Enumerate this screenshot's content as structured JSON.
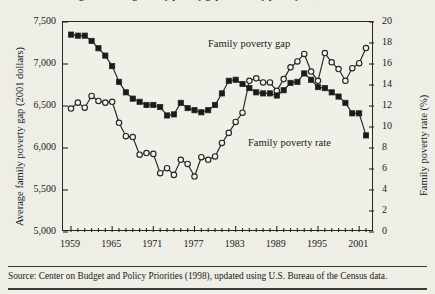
{
  "figure": {
    "title_clipped": "Figure 2. Average family poverty gap and family poverty rate, 1959-2002",
    "source_note": "Source: Center on Budget and Policy Priorities (1998), updated using U.S. Bureau of the Census data."
  },
  "annotations": {
    "gap_label": "Family poverty gap",
    "rate_label": "Family poverty rate"
  },
  "axes": {
    "left_title": "Average family poverty gap (2001 dollars)",
    "right_title": "Family poverty rate (%)",
    "left_ticks": [
      "7,500",
      "7,000",
      "6,500",
      "6,000",
      "5,500",
      "5,000"
    ],
    "right_ticks": [
      "20",
      "18",
      "16",
      "14",
      "12",
      "10",
      "8",
      "6",
      "4",
      "2",
      "0"
    ],
    "x_ticks": [
      "1959",
      "1965",
      "1971",
      "1977",
      "1983",
      "1989",
      "1995",
      "2001"
    ]
  },
  "colors": {
    "background": "#efeee6",
    "plot_background": "#f1f0e8",
    "ink": "#262626",
    "marker_fill_gap": "#f5f4ec",
    "marker_fill_rate": "#1a1a1a"
  },
  "chart_data": {
    "type": "line",
    "title": "Average family poverty gap and family poverty rate, 1959-2002",
    "xlabel": "",
    "ylabel": "Average family poverty gap (2001 dollars)",
    "y2label": "Family poverty rate (%)",
    "xlim": [
      1959,
      2002
    ],
    "ylim": [
      5000,
      7500
    ],
    "y2lim": [
      0,
      20
    ],
    "grid": false,
    "legend": "inline annotations",
    "x": [
      1959,
      1960,
      1961,
      1962,
      1963,
      1964,
      1965,
      1966,
      1967,
      1968,
      1969,
      1970,
      1971,
      1972,
      1973,
      1974,
      1975,
      1976,
      1977,
      1978,
      1979,
      1980,
      1981,
      1982,
      1983,
      1984,
      1985,
      1986,
      1987,
      1988,
      1989,
      1990,
      1991,
      1992,
      1993,
      1994,
      1995,
      1996,
      1997,
      1998,
      1999,
      2000,
      2001,
      2002
    ],
    "series": [
      {
        "name": "Family poverty gap",
        "axis": "left",
        "marker": "open-circle",
        "values": [
          6470,
          6540,
          6480,
          6620,
          6560,
          6540,
          6550,
          6300,
          6140,
          6130,
          5920,
          5940,
          5930,
          5700,
          5760,
          5680,
          5860,
          5810,
          5660,
          5890,
          5860,
          5900,
          6060,
          6180,
          6310,
          6420,
          6800,
          6830,
          6780,
          6780,
          6680,
          6820,
          6960,
          7030,
          7120,
          6910,
          6800,
          7130,
          7020,
          6940,
          6800,
          6950,
          7010,
          7190
        ]
      },
      {
        "name": "Family poverty rate",
        "axis": "right",
        "marker": "filled-square",
        "values": [
          18.8,
          18.7,
          18.7,
          18.2,
          17.5,
          16.8,
          15.8,
          14.3,
          13.3,
          12.7,
          12.4,
          12.1,
          12.1,
          11.9,
          11.1,
          11.2,
          12.3,
          11.8,
          11.6,
          11.4,
          11.6,
          12.1,
          13.2,
          14.4,
          14.5,
          14.1,
          13.7,
          13.3,
          13.2,
          13.2,
          13.0,
          13.5,
          14.2,
          14.3,
          15.1,
          14.5,
          13.8,
          13.7,
          13.3,
          12.9,
          12.3,
          11.3,
          11.3,
          9.2
        ]
      }
    ]
  }
}
